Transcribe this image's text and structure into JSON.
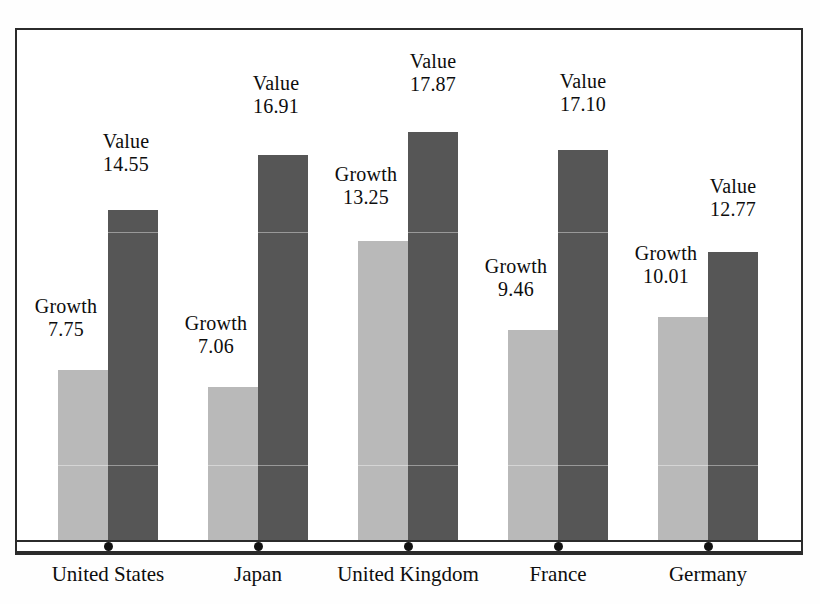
{
  "chart_data": {
    "type": "bar",
    "title": "",
    "xlabel": "",
    "ylabel": "",
    "grid": false,
    "legend_position": "none",
    "categories": [
      "United States",
      "Japan",
      "United Kingdom",
      "France",
      "Germany"
    ],
    "series": [
      {
        "name": "Growth",
        "color": "#b9b9b9",
        "values": [
          7.75,
          7.06,
          13.25,
          9.46,
          10.01
        ]
      },
      {
        "name": "Value",
        "color": "#565656",
        "values": [
          14.55,
          16.91,
          17.87,
          17.1,
          12.77
        ]
      }
    ],
    "ylim": [
      0,
      22.2
    ],
    "point_labels": [
      {
        "series": "Growth",
        "category": "United States",
        "name": "Growth",
        "value": "7.75"
      },
      {
        "series": "Value",
        "category": "United States",
        "name": "Value",
        "value": "14.55"
      },
      {
        "series": "Growth",
        "category": "Japan",
        "name": "Growth",
        "value": "7.06"
      },
      {
        "series": "Value",
        "category": "Japan",
        "name": "Value",
        "value": "16.91"
      },
      {
        "series": "Growth",
        "category": "United Kingdom",
        "name": "Growth",
        "value": "13.25"
      },
      {
        "series": "Value",
        "category": "United Kingdom",
        "name": "Value",
        "value": "17.87"
      },
      {
        "series": "Growth",
        "category": "France",
        "name": "Growth",
        "value": "9.46"
      },
      {
        "series": "Value",
        "category": "France",
        "name": "Value",
        "value": "17.10"
      },
      {
        "series": "Growth",
        "category": "Germany",
        "name": "Growth",
        "value": "10.01"
      },
      {
        "series": "Value",
        "category": "Germany",
        "name": "Value",
        "value": "12.77"
      }
    ]
  },
  "labels": {
    "us_growth_name": "Growth",
    "us_growth_value": "7.75",
    "us_value_name": "Value",
    "us_value_value": "14.55",
    "jp_growth_name": "Growth",
    "jp_growth_value": "7.06",
    "jp_value_name": "Value",
    "jp_value_value": "16.91",
    "uk_growth_name": "Growth",
    "uk_growth_value": "13.25",
    "uk_value_name": "Value",
    "uk_value_value": "17.87",
    "fr_growth_name": "Growth",
    "fr_growth_value": "9.46",
    "fr_value_name": "Value",
    "fr_value_value": "17.10",
    "de_growth_name": "Growth",
    "de_growth_value": "10.01",
    "de_value_name": "Value",
    "de_value_value": "12.77"
  },
  "axis": {
    "cat_0": "United States",
    "cat_1": "Japan",
    "cat_2": "United Kingdom",
    "cat_3": "France",
    "cat_4": "Germany"
  },
  "colors": {
    "growth_bar": "#b9b9b9",
    "value_bar": "#565656",
    "frame": "#2b2b2b",
    "text": "#0d0d0d",
    "background": "#ffffff"
  }
}
